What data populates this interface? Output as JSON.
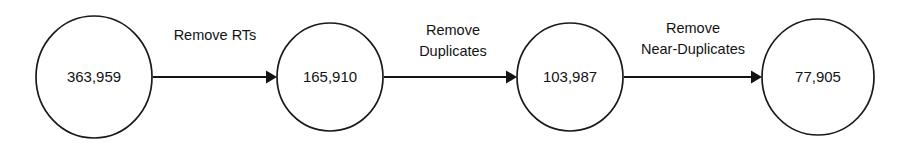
{
  "diagram": {
    "type": "flow-pipeline",
    "orientation": "horizontal",
    "background_color": "#ffffff",
    "stroke_color": "#131313",
    "text_color": "#131313",
    "nodes": [
      {
        "id": "stage-1",
        "value": "363,959",
        "count": 363959,
        "shape": "ellipse",
        "cx": 94,
        "cy": 77,
        "rx": 58,
        "ry": 61
      },
      {
        "id": "stage-2",
        "value": "165,910",
        "count": 165910,
        "shape": "ellipse",
        "cx": 330,
        "cy": 77,
        "rx": 53,
        "ry": 54
      },
      {
        "id": "stage-3",
        "value": "103,987",
        "count": 103987,
        "shape": "ellipse",
        "cx": 570,
        "cy": 77,
        "rx": 53,
        "ry": 54
      },
      {
        "id": "stage-4",
        "value": "77,905",
        "count": 77905,
        "shape": "ellipse",
        "cx": 818,
        "cy": 77,
        "rx": 56,
        "ry": 58
      }
    ],
    "edges": [
      {
        "id": "edge-1",
        "from": "stage-1",
        "to": "stage-2",
        "label_lines": [
          "Remove RTs"
        ],
        "label_cx": 215,
        "x1": 153,
        "x2": 277,
        "y": 77
      },
      {
        "id": "edge-2",
        "from": "stage-2",
        "to": "stage-3",
        "label_lines": [
          "Remove",
          "Duplicates"
        ],
        "label_cx": 453,
        "x1": 384,
        "x2": 517,
        "y": 77
      },
      {
        "id": "edge-3",
        "from": "stage-3",
        "to": "stage-4",
        "label_lines": [
          "Remove",
          "Near-Duplicates"
        ],
        "label_cx": 693,
        "x1": 624,
        "x2": 762,
        "y": 77
      }
    ]
  }
}
